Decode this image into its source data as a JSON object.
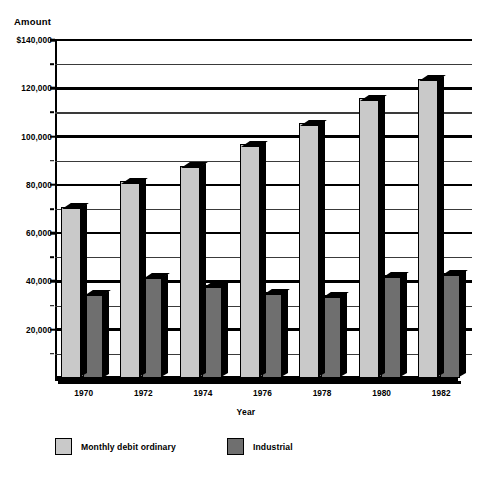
{
  "chart_data": {
    "type": "bar",
    "title": "",
    "xlabel": "Year",
    "ylabel": "Amount",
    "categories": [
      "1970",
      "1972",
      "1974",
      "1976",
      "1978",
      "1980",
      "1982"
    ],
    "series": [
      {
        "name": "Monthly debit ordinary",
        "color": "#c9c9c9",
        "values": [
          71000,
          81500,
          88000,
          97000,
          105500,
          116000,
          124000
        ]
      },
      {
        "name": "Industrial",
        "color": "#6f6f6f",
        "values": [
          35000,
          42000,
          38500,
          35500,
          34500,
          42500,
          43500
        ]
      }
    ],
    "ylim": [
      0,
      140000
    ],
    "y_major_ticks": [
      20000,
      40000,
      60000,
      80000,
      100000,
      120000,
      140000
    ],
    "y_minor_ticks": [
      10000,
      30000,
      50000,
      70000,
      90000,
      110000,
      130000
    ],
    "y_tick_labels": [
      "20,000",
      "40,000",
      "60,000",
      "80,000",
      "100,000",
      "120,000",
      "$140,000"
    ],
    "grid": true,
    "legend_position": "bottom-left",
    "legend": [
      "Monthly debit ordinary",
      "Industrial"
    ]
  }
}
